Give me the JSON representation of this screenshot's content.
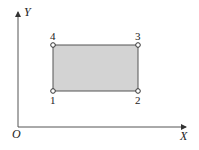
{
  "diagram": {
    "axes": {
      "x_label": "X",
      "y_label": "Y",
      "origin_label": "O"
    },
    "rectangle": {
      "fill": "#d3d3d3",
      "stroke": "#555555"
    },
    "nodes": [
      {
        "id": "1",
        "label": "1",
        "position": "bottom-left"
      },
      {
        "id": "2",
        "label": "2",
        "position": "bottom-right"
      },
      {
        "id": "3",
        "label": "3",
        "position": "top-right"
      },
      {
        "id": "4",
        "label": "4",
        "position": "top-left"
      }
    ]
  }
}
